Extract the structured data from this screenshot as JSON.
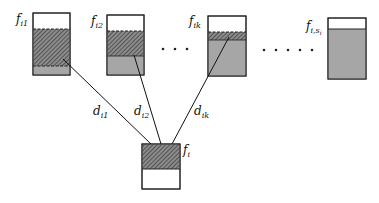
{
  "diagram": {
    "colors": {
      "gray": "#a6a6a6",
      "hatch": "#555555",
      "stroke": "#222222"
    },
    "files": [
      {
        "label_main": "f",
        "label_sub": "i1"
      },
      {
        "label_main": "f",
        "label_sub": "i2"
      },
      {
        "label_main": "f",
        "label_sub": "ik"
      },
      {
        "label_main": "f",
        "label_sub": "i,s",
        "label_subsub": "i"
      }
    ],
    "target": {
      "label_main": "f",
      "label_sub": "i"
    },
    "edges": [
      {
        "label_main": "d",
        "label_sub": "i1"
      },
      {
        "label_main": "d",
        "label_sub": "i2"
      },
      {
        "label_main": "d",
        "label_sub": "ik"
      }
    ],
    "ellipsis_groups": [
      3,
      5
    ]
  }
}
